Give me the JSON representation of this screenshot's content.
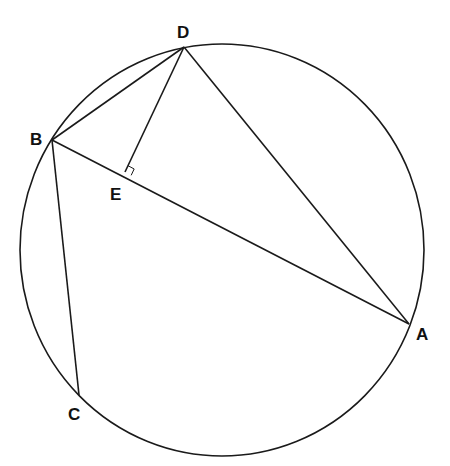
{
  "diagram": {
    "type": "geometry",
    "circle": {
      "cx": 222,
      "cy": 250,
      "rx": 202,
      "ry": 206
    },
    "points": {
      "A": {
        "x": 409,
        "y": 324,
        "label": "A",
        "lx": 416,
        "ly": 340
      },
      "B": {
        "x": 52,
        "y": 140,
        "label": "B",
        "lx": 30,
        "ly": 145
      },
      "C": {
        "x": 79,
        "y": 395,
        "label": "C",
        "lx": 68,
        "ly": 420
      },
      "D": {
        "x": 184,
        "y": 47,
        "label": "D",
        "lx": 177,
        "ly": 38
      },
      "E": {
        "x": 125,
        "y": 172,
        "label": "E",
        "lx": 110,
        "ly": 200
      }
    },
    "segments": [
      [
        "B",
        "D"
      ],
      [
        "D",
        "A"
      ],
      [
        "B",
        "A"
      ],
      [
        "B",
        "C"
      ],
      [
        "D",
        "E"
      ]
    ],
    "right_angle_marker": {
      "at": "E",
      "between": [
        "D",
        "A"
      ]
    },
    "stroke_color": "#1a1a1a",
    "background": "#ffffff"
  }
}
